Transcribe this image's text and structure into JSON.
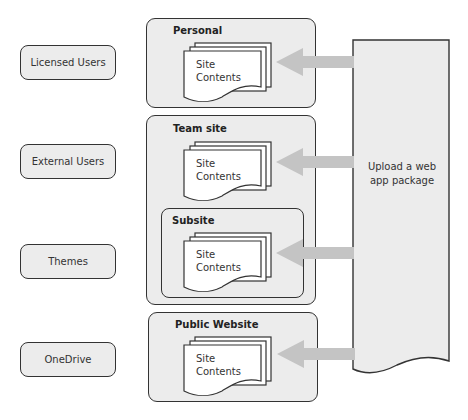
{
  "left_items": [
    {
      "label": "Licensed Users"
    },
    {
      "label": "External Users"
    },
    {
      "label": "Themes"
    },
    {
      "label": "OneDrive"
    }
  ],
  "containers": {
    "personal": {
      "title": "Personal",
      "doc_line1": "Site",
      "doc_line2": "Contents"
    },
    "team_site": {
      "title": "Team site",
      "doc_line1": "Site",
      "doc_line2": "Contents"
    },
    "subsite": {
      "title": "Subsite",
      "doc_line1": "Site",
      "doc_line2": "Contents"
    },
    "public_website": {
      "title": "Public Website",
      "doc_line1": "Site",
      "doc_line2": "Contents"
    }
  },
  "upload": {
    "label_line1": "Upload a web",
    "label_line2": "app package"
  },
  "colors": {
    "fill": "#ececec",
    "arrow": "#c4c4c4",
    "stroke": "#333333"
  }
}
